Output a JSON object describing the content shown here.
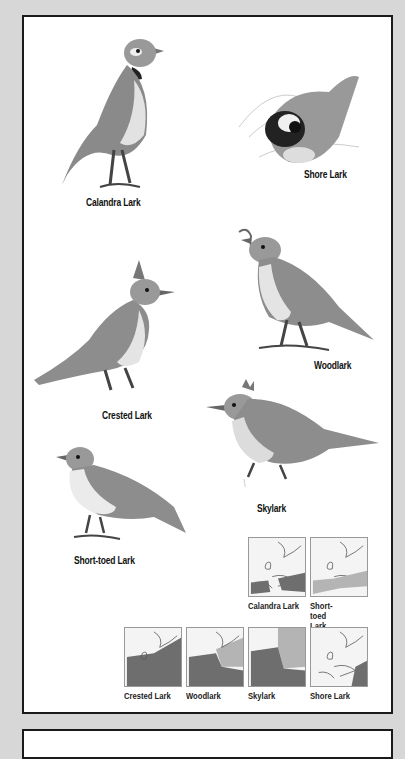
{
  "plate": {
    "birds": [
      {
        "name": "Calandra Lark"
      },
      {
        "name": "Shore Lark"
      },
      {
        "name": "Woodlark"
      },
      {
        "name": "Crested Lark"
      },
      {
        "name": "Skylark"
      },
      {
        "name": "Short-toed Lark"
      }
    ],
    "maps": [
      {
        "label": "Calandra Lark"
      },
      {
        "label": "Short-toed Lark"
      },
      {
        "label": "Crested Lark"
      },
      {
        "label": "Woodlark"
      },
      {
        "label": "Skylark"
      },
      {
        "label": "Shore Lark"
      }
    ]
  },
  "colors": {
    "background": "#d7d7d7",
    "plate": "#ffffff",
    "border": "#1a1a1a",
    "range_dark": "#6e6e6e",
    "range_light": "#b4b4b4"
  }
}
